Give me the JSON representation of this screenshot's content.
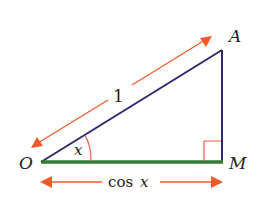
{
  "diagram": {
    "type": "right-triangle",
    "vertices": {
      "O": {
        "label": "O",
        "x": 41,
        "y": 162
      },
      "A": {
        "label": "A",
        "x": 222,
        "y": 50
      },
      "M": {
        "label": "M",
        "x": 222,
        "y": 162
      }
    },
    "angle_label": "x",
    "hypotenuse_label": "1",
    "base_label_func": "cos",
    "base_label_var": "x",
    "colors": {
      "triangle": "#2e2a6e",
      "base": "#2e7d32",
      "arrow": "#f05a28",
      "angle_arc": "#e8604c",
      "right_angle": "#e8604c"
    }
  }
}
